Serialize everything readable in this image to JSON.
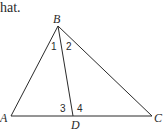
{
  "text_fragment": "hat.",
  "diagram": {
    "type": "triangle",
    "vertices": {
      "A": {
        "label": "A",
        "x": 11,
        "y": 116
      },
      "B": {
        "label": "B",
        "x": 58,
        "y": 26
      },
      "C": {
        "label": "C",
        "x": 152,
        "y": 116
      },
      "D": {
        "label": "D",
        "x": 73,
        "y": 116
      }
    },
    "segments": [
      "AB",
      "BC",
      "AC",
      "BD"
    ],
    "angle_labels": {
      "a1": "1",
      "a2": "2",
      "a3": "3",
      "a4": "4"
    },
    "stroke_color": "#2a2a2a"
  }
}
